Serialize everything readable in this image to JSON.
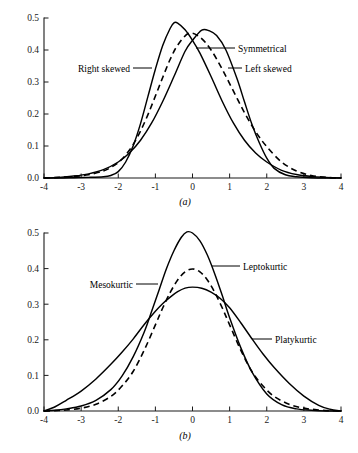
{
  "figure": {
    "background": "#ffffff",
    "ink": "#000000"
  },
  "chart_data": [
    {
      "type": "line",
      "panel_label": "(a)",
      "title": "Skewness",
      "xlabel": "",
      "ylabel": "",
      "xlim": [
        -4,
        4
      ],
      "ylim": [
        0.0,
        0.5
      ],
      "xticks": [
        -4,
        -3,
        -2,
        -1,
        0,
        1,
        2,
        3,
        4
      ],
      "xticklabels": [
        "-4",
        "-3",
        "-2",
        "-1",
        "0",
        "1",
        "2",
        "3",
        "4"
      ],
      "yticks": [
        0.0,
        0.1,
        0.2,
        0.3,
        0.4,
        0.5
      ],
      "yticklabels": [
        "0.0",
        "0.1",
        "0.2",
        "0.3",
        "0.4",
        "0.5"
      ],
      "grid": false,
      "legend_position": "inline-annotations",
      "series": [
        {
          "name": "Right skewed",
          "style": "solid",
          "peak_x": -0.5,
          "peak_y": 0.485,
          "x": [
            -4.0,
            -3.6,
            -3.2,
            -2.8,
            -2.4,
            -2.2,
            -2.0,
            -1.8,
            -1.6,
            -1.4,
            -1.2,
            -1.0,
            -0.8,
            -0.6,
            -0.5,
            -0.4,
            -0.2,
            0.0,
            0.2,
            0.5,
            0.8,
            1.1,
            1.4,
            1.7,
            2.0,
            2.4,
            2.8,
            3.2,
            3.6,
            4.0
          ],
          "y": [
            0.0,
            0.0,
            0.001,
            0.002,
            0.004,
            0.008,
            0.02,
            0.05,
            0.1,
            0.17,
            0.255,
            0.34,
            0.415,
            0.468,
            0.485,
            0.484,
            0.463,
            0.43,
            0.39,
            0.317,
            0.24,
            0.172,
            0.118,
            0.078,
            0.05,
            0.024,
            0.011,
            0.005,
            0.002,
            0.0
          ]
        },
        {
          "name": "Symmetrical",
          "style": "dashed",
          "peak_x": -0.1,
          "peak_y": 0.452,
          "x": [
            -4.0,
            -3.6,
            -3.2,
            -2.8,
            -2.4,
            -2.2,
            -2.0,
            -1.8,
            -1.6,
            -1.4,
            -1.2,
            -1.0,
            -0.8,
            -0.6,
            -0.4,
            -0.1,
            0.2,
            0.5,
            0.8,
            1.1,
            1.4,
            1.7,
            2.0,
            2.4,
            2.8,
            3.2,
            3.6,
            4.0
          ],
          "y": [
            0.0,
            0.002,
            0.005,
            0.01,
            0.022,
            0.033,
            0.048,
            0.072,
            0.104,
            0.147,
            0.198,
            0.256,
            0.315,
            0.371,
            0.415,
            0.452,
            0.44,
            0.4,
            0.34,
            0.272,
            0.204,
            0.145,
            0.098,
            0.05,
            0.022,
            0.008,
            0.002,
            0.0
          ]
        },
        {
          "name": "Left skewed",
          "style": "solid",
          "peak_x": 0.25,
          "peak_y": 0.462,
          "x": [
            -4.0,
            -3.6,
            -3.2,
            -2.8,
            -2.4,
            -2.0,
            -1.7,
            -1.4,
            -1.1,
            -0.8,
            -0.5,
            -0.2,
            0.0,
            0.25,
            0.45,
            0.65,
            0.9,
            1.2,
            1.4,
            1.6,
            1.8,
            2.0,
            2.2,
            2.5,
            2.8,
            3.2,
            3.6,
            4.0
          ],
          "y": [
            0.0,
            0.002,
            0.006,
            0.013,
            0.026,
            0.05,
            0.078,
            0.118,
            0.172,
            0.24,
            0.317,
            0.396,
            0.43,
            0.462,
            0.46,
            0.445,
            0.4,
            0.31,
            0.238,
            0.168,
            0.11,
            0.062,
            0.03,
            0.01,
            0.004,
            0.001,
            0.0,
            0.0
          ]
        }
      ],
      "annotations": [
        {
          "text": "Right skewed",
          "side": "left"
        },
        {
          "text": "Symmetrical",
          "side": "right"
        },
        {
          "text": "Left skewed",
          "side": "right"
        }
      ]
    },
    {
      "type": "line",
      "panel_label": "(b)",
      "title": "Kurtosis",
      "xlabel": "",
      "ylabel": "",
      "xlim": [
        -4,
        4
      ],
      "ylim": [
        0.0,
        0.5
      ],
      "xticks": [
        -4,
        -3,
        -2,
        -1,
        0,
        1,
        2,
        3,
        4
      ],
      "xticklabels": [
        "-4",
        "-3",
        "-2",
        "-1",
        "0",
        "1",
        "2",
        "3",
        "4"
      ],
      "yticks": [
        0.0,
        0.1,
        0.2,
        0.3,
        0.4,
        0.5
      ],
      "yticklabels": [
        "0.0",
        "0.1",
        "0.2",
        "0.3",
        "0.4",
        "0.5"
      ],
      "grid": false,
      "legend_position": "inline-annotations",
      "series": [
        {
          "name": "Leptokurtic",
          "style": "solid",
          "peak_x": -0.15,
          "peak_y": 0.503,
          "x": [
            -4.0,
            -3.7,
            -3.4,
            -3.0,
            -2.6,
            -2.2,
            -1.9,
            -1.6,
            -1.3,
            -1.1,
            -0.9,
            -0.7,
            -0.5,
            -0.3,
            -0.15,
            0.0,
            0.2,
            0.4,
            0.6,
            0.8,
            1.0,
            1.3,
            1.6,
            2.0,
            2.4,
            2.8,
            3.2,
            3.6,
            4.0
          ],
          "y": [
            0.0,
            0.002,
            0.006,
            0.014,
            0.03,
            0.06,
            0.098,
            0.152,
            0.222,
            0.28,
            0.34,
            0.4,
            0.45,
            0.488,
            0.503,
            0.5,
            0.478,
            0.438,
            0.385,
            0.325,
            0.262,
            0.178,
            0.11,
            0.048,
            0.018,
            0.006,
            0.002,
            0.0,
            0.0
          ]
        },
        {
          "name": "Mesokurtic",
          "style": "dashed",
          "peak_x": 0.0,
          "peak_y": 0.399,
          "x": [
            -4.0,
            -3.7,
            -3.4,
            -3.0,
            -2.6,
            -2.2,
            -1.9,
            -1.6,
            -1.3,
            -1.0,
            -0.8,
            -0.6,
            -0.4,
            -0.2,
            0.0,
            0.2,
            0.4,
            0.6,
            0.8,
            1.0,
            1.3,
            1.6,
            1.9,
            2.2,
            2.6,
            3.0,
            3.4,
            3.7,
            4.0
          ],
          "y": [
            0.0,
            0.001,
            0.003,
            0.008,
            0.019,
            0.041,
            0.07,
            0.111,
            0.171,
            0.242,
            0.29,
            0.333,
            0.368,
            0.391,
            0.399,
            0.391,
            0.368,
            0.333,
            0.29,
            0.242,
            0.171,
            0.111,
            0.07,
            0.041,
            0.019,
            0.008,
            0.003,
            0.001,
            0.0
          ]
        },
        {
          "name": "Platykurtic",
          "style": "solid",
          "peak_x": -0.05,
          "peak_y": 0.348,
          "x": [
            -4.0,
            -3.7,
            -3.4,
            -3.0,
            -2.6,
            -2.2,
            -1.9,
            -1.6,
            -1.3,
            -1.0,
            -0.8,
            -0.6,
            -0.4,
            -0.2,
            0.0,
            0.25,
            0.5,
            0.75,
            1.0,
            1.3,
            1.6,
            1.9,
            2.2,
            2.6,
            3.0,
            3.4,
            3.7,
            4.0
          ],
          "y": [
            0.0,
            0.012,
            0.03,
            0.056,
            0.09,
            0.131,
            0.165,
            0.202,
            0.243,
            0.28,
            0.302,
            0.32,
            0.335,
            0.345,
            0.348,
            0.345,
            0.334,
            0.316,
            0.29,
            0.248,
            0.203,
            0.16,
            0.122,
            0.078,
            0.042,
            0.016,
            0.005,
            0.0
          ]
        }
      ],
      "annotations": [
        {
          "text": "Leptokurtic",
          "side": "right"
        },
        {
          "text": "Mesokurtic",
          "side": "left"
        },
        {
          "text": "Platykurtic",
          "side": "right"
        }
      ]
    }
  ]
}
